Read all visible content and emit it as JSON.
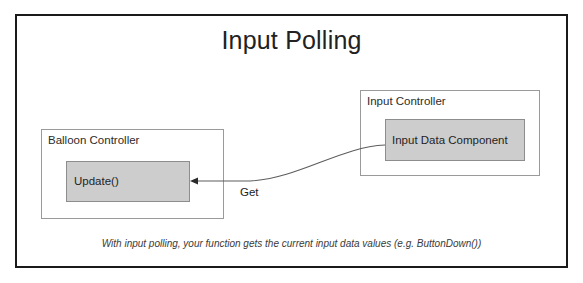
{
  "slide": {
    "title": "Input Polling",
    "caption": "With input polling, your function gets the current input data values (e.g. ButtonDown())"
  },
  "boxes": {
    "balloon_controller": {
      "label": "Balloon Controller",
      "component": "Update()"
    },
    "input_controller": {
      "label": "Input Controller",
      "component": "Input Data Component"
    }
  },
  "connector": {
    "label": "Get",
    "direction": "input-data-component-to-update",
    "arrowhead": "left"
  },
  "colors": {
    "frame_border": "#1a1a1a",
    "box_border": "#9a9a9a",
    "component_fill": "#cdcdcd",
    "component_border": "#8d8d8d",
    "text": "#222222",
    "background": "#ffffff"
  }
}
